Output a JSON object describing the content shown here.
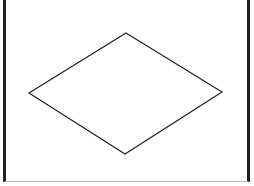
{
  "diagram": {
    "shape": "diamond",
    "stroke_color": "#222222",
    "fill_color": "#ffffff",
    "vertices": {
      "top": [
        126,
        33
      ],
      "right": [
        222,
        92
      ],
      "bottom": [
        125,
        154
      ],
      "left": [
        29,
        93
      ]
    }
  }
}
